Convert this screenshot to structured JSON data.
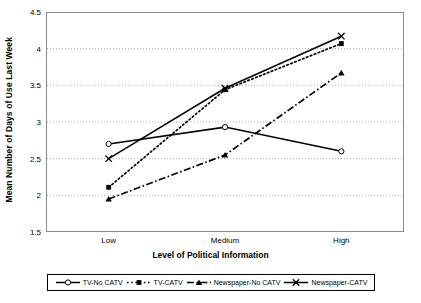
{
  "chart_data": {
    "type": "line",
    "title": "",
    "xlabel": "Level of Political Information",
    "ylabel": "Mean Number of Days of Use Last Week",
    "categories": [
      "Low",
      "Medium",
      "High"
    ],
    "ylim": [
      1.5,
      4.5
    ],
    "yticks": [
      "1.5",
      "2",
      "2.5",
      "3",
      "3.5",
      "4",
      "4.5"
    ],
    "ytick_values": [
      1.5,
      2,
      2.5,
      3,
      3.5,
      4,
      4.5
    ],
    "grid": "horizontal-dotted",
    "legend_position": "bottom",
    "series": [
      {
        "name": "TV-No CATV",
        "values": [
          2.7,
          2.93,
          2.6
        ],
        "marker": "open-circle",
        "line_style": "solid",
        "color": "#000000"
      },
      {
        "name": "TV-CATV",
        "values": [
          2.11,
          3.44,
          4.07
        ],
        "marker": "filled-square",
        "line_style": "dotted",
        "color": "#000000"
      },
      {
        "name": "Newspaper-No CATV",
        "values": [
          1.95,
          2.55,
          3.67
        ],
        "marker": "filled-triangle",
        "line_style": "dash-dot",
        "color": "#000000"
      },
      {
        "name": "Newspaper-CATV",
        "values": [
          2.5,
          3.46,
          4.17
        ],
        "marker": "x-cross",
        "line_style": "solid",
        "color": "#000000"
      }
    ]
  },
  "axis": {
    "y_title": "Mean Number of Days of Use Last Week",
    "x_title": "Level of Political Information",
    "y_ticks": [
      "4.5",
      "4",
      "3.5",
      "3",
      "2.5",
      "2",
      "1.5"
    ],
    "x_ticks": [
      "Low",
      "Medium",
      "High"
    ]
  },
  "legend": {
    "items": [
      {
        "label": "TV-No CATV",
        "marker": "open-circle"
      },
      {
        "label": "TV-CATV",
        "marker": "filled-square"
      },
      {
        "label": "Newspaper-No CATV",
        "marker": "filled-triangle"
      },
      {
        "label": "Newspaper-CATV",
        "marker": "x-cross"
      }
    ]
  }
}
